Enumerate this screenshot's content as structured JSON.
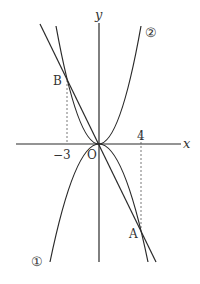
{
  "diagram": {
    "type": "coordinate-graph",
    "axes": {
      "x_label": "x",
      "y_label": "y",
      "origin_label": "O",
      "ticks": [
        {
          "value": -3,
          "label": "−3"
        },
        {
          "value": 4,
          "label": "4"
        }
      ]
    },
    "curves": [
      {
        "id": "parabola-1",
        "label": "①",
        "kind": "parabola",
        "opens": "down"
      },
      {
        "id": "parabola-2",
        "label": "②",
        "kind": "parabola",
        "opens": "up"
      },
      {
        "id": "line-ab",
        "label": "",
        "kind": "line",
        "passes_through": [
          "B",
          "O",
          "A"
        ]
      }
    ],
    "points": [
      {
        "name": "A",
        "x": 4
      },
      {
        "name": "B",
        "x": -3
      }
    ],
    "colors": {
      "stroke": "#2a2a2a",
      "text": "#333333",
      "background": "#ffffff"
    }
  }
}
